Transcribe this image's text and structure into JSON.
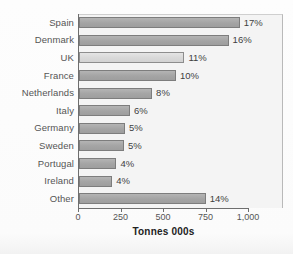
{
  "chart_data": {
    "type": "bar",
    "orientation": "horizontal",
    "title": "",
    "xlabel": "Tonnes 000s",
    "ylabel": "",
    "xlim": [
      0,
      1000
    ],
    "grid": false,
    "legend": null,
    "xticks": [
      0,
      250,
      500,
      750,
      1000
    ],
    "xtick_labels": [
      "0",
      "250",
      "500",
      "750",
      "1,000"
    ],
    "categories": [
      "Spain",
      "Denmark",
      "UK",
      "France",
      "Netherlands",
      "Italy",
      "Germany",
      "Sweden",
      "Portugal",
      "Ireland",
      "Other"
    ],
    "values": [
      945,
      880,
      620,
      570,
      430,
      300,
      270,
      265,
      220,
      195,
      745
    ],
    "data_labels": [
      "17%",
      "16%",
      "11%",
      "10%",
      "8%",
      "6%",
      "5%",
      "5%",
      "4%",
      "4%",
      "14%"
    ],
    "highlight_category": "UK",
    "colors": {
      "bar": "#a9a9a9",
      "bar_border": "#7d7d7d",
      "bar_highlight": "#dcdcdc",
      "plot_background": "#f4f4f4",
      "axis": "#6e6e6e",
      "label_text": "#555555",
      "value_text": "#3f3f3f",
      "title_text": "#222222"
    }
  }
}
